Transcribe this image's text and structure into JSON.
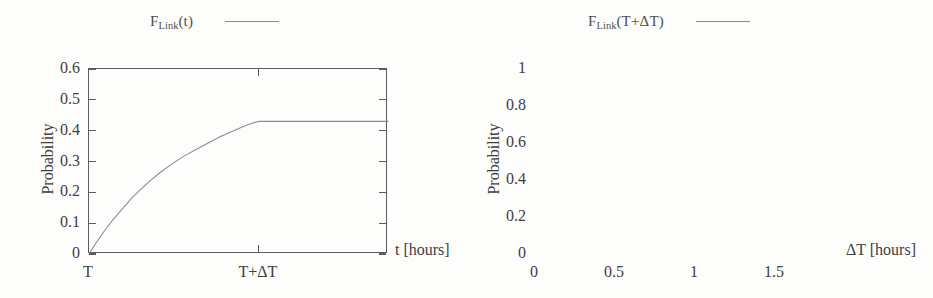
{
  "figure": {
    "background_color": "#fdfdfc",
    "ink_color": "#4a4a4a",
    "curve_color": "#8d8d8d"
  },
  "chart_data": [
    {
      "id": "left",
      "type": "line",
      "title": "",
      "legend": {
        "text": "F_Link(t)",
        "base": "F",
        "sub": "Link",
        "arg": "(t)",
        "position": "top-center"
      },
      "xlabel": "t [hours]",
      "ylabel": "Probability",
      "xlim": [
        0,
        1
      ],
      "ylim": [
        0,
        0.6
      ],
      "grid": false,
      "yticks": [
        0,
        0.1,
        0.2,
        0.3,
        0.4,
        0.5,
        0.6
      ],
      "yticklabels": [
        "0",
        "0.1",
        "0.2",
        "0.3",
        "0.4",
        "0.5",
        "0.6"
      ],
      "xticks": [
        0.0,
        0.568
      ],
      "xticklabels": [
        "T",
        "T+ΔT"
      ],
      "plateau_value": 0.43,
      "saturation_x": 0.568,
      "x": [
        0.0,
        0.02,
        0.05,
        0.08,
        0.11,
        0.14,
        0.17,
        0.2,
        0.24,
        0.28,
        0.32,
        0.36,
        0.4,
        0.44,
        0.48,
        0.52,
        0.555,
        0.568,
        0.62,
        0.7,
        0.8,
        0.9,
        1.0
      ],
      "y": [
        0.0,
        0.031,
        0.073,
        0.111,
        0.145,
        0.178,
        0.207,
        0.234,
        0.266,
        0.294,
        0.319,
        0.34,
        0.361,
        0.381,
        0.398,
        0.415,
        0.427,
        0.43,
        0.43,
        0.43,
        0.43,
        0.43,
        0.43
      ]
    },
    {
      "id": "right",
      "type": "line",
      "title": "",
      "legend": {
        "text": "F_Link(T+ΔT)",
        "base": "F",
        "sub": "Link",
        "arg": "(T+ΔT)",
        "position": "top-center"
      },
      "xlabel": "ΔT [hours]",
      "ylabel": "Probability",
      "xlim": [
        0,
        1.9
      ],
      "ylim": [
        0,
        1
      ],
      "grid": false,
      "yticks": [
        0,
        0.2,
        0.4,
        0.6,
        0.8,
        1
      ],
      "yticklabels": [
        "0",
        "0.2",
        "0.4",
        "0.6",
        "0.8",
        "1"
      ],
      "xticks": [
        0,
        0.5,
        1,
        1.5
      ],
      "xticklabels": [
        "0",
        "0.5",
        "1",
        "1.5"
      ],
      "plateau_value": 1.0,
      "x": [
        0.0,
        0.03,
        0.06,
        0.09,
        0.12,
        0.15,
        0.18,
        0.21,
        0.25,
        0.3,
        0.35,
        0.4,
        0.45,
        0.5,
        0.6,
        0.7,
        0.85,
        1.0,
        1.2,
        1.5,
        1.9
      ],
      "y": [
        0.0,
        0.055,
        0.14,
        0.245,
        0.355,
        0.46,
        0.555,
        0.64,
        0.73,
        0.81,
        0.865,
        0.903,
        0.928,
        0.946,
        0.968,
        0.981,
        0.99,
        0.995,
        0.998,
        1.0,
        1.0
      ]
    }
  ]
}
